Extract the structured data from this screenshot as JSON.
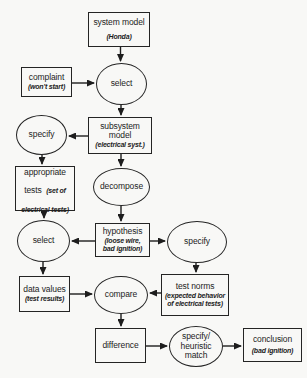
{
  "canvas": {
    "background": "#f8f8f6",
    "ink": "#1d1d1d"
  },
  "nodes": {
    "system_model": {
      "shape": "box",
      "title": "system model",
      "note": "(Honda)"
    },
    "complaint": {
      "shape": "box",
      "title": "complaint",
      "note": "(won't start)"
    },
    "select_1": {
      "shape": "ellipse",
      "title": "select"
    },
    "subsystem_model": {
      "shape": "box",
      "title": "subsystem model",
      "note": "(electrical syst.)"
    },
    "specify_left": {
      "shape": "ellipse",
      "title": "specify"
    },
    "appropriate_tests": {
      "shape": "box",
      "title": "appropriate tests",
      "note": "(set of electrical tests)"
    },
    "decompose": {
      "shape": "ellipse",
      "title": "decompose"
    },
    "select_2": {
      "shape": "ellipse",
      "title": "select"
    },
    "hypothesis": {
      "shape": "box",
      "title": "hypothesis",
      "note": "(loose wire, bad ignition)"
    },
    "specify_right": {
      "shape": "ellipse",
      "title": "specify"
    },
    "data_values": {
      "shape": "box",
      "title": "data values",
      "note": "(test results)"
    },
    "compare": {
      "shape": "ellipse",
      "title": "compare"
    },
    "test_norms": {
      "shape": "box",
      "title": "test norms",
      "note": "(expected behavior of electrical tests)"
    },
    "difference": {
      "shape": "box",
      "title": "difference"
    },
    "specify_heuristic": {
      "shape": "ellipse",
      "title": "specify/ heuristic match"
    },
    "conclusion": {
      "shape": "box",
      "title": "conclusion",
      "note": "(bad ignition)"
    }
  },
  "edges": [
    {
      "from": "system-model",
      "to": "select-1",
      "x1": 120.5,
      "y1": 47,
      "x2": 120.5,
      "y2": 61
    },
    {
      "from": "complaint",
      "to": "select-1",
      "x1": 72,
      "y1": 83,
      "x2": 94,
      "y2": 83
    },
    {
      "from": "select-1",
      "to": "subsystem-model",
      "x1": 121,
      "y1": 105,
      "x2": 121,
      "y2": 115
    },
    {
      "from": "subsystem-model",
      "to": "specify-left",
      "x1": 88,
      "y1": 136,
      "x2": 69,
      "y2": 136
    },
    {
      "from": "specify-left",
      "to": "appropriate-tests",
      "x1": 42,
      "y1": 155,
      "x2": 42,
      "y2": 164
    },
    {
      "from": "subsystem-model",
      "to": "decompose",
      "x1": 121,
      "y1": 154,
      "x2": 121,
      "y2": 166
    },
    {
      "from": "appropriate-tests",
      "to": "select-2",
      "x1": 44,
      "y1": 211,
      "x2": 44,
      "y2": 218
    },
    {
      "from": "decompose",
      "to": "hypothesis",
      "x1": 121,
      "y1": 206,
      "x2": 121,
      "y2": 221
    },
    {
      "from": "hypothesis",
      "to": "select-2",
      "x1": 95,
      "y1": 241,
      "x2": 72,
      "y2": 241
    },
    {
      "from": "hypothesis",
      "to": "specify-right",
      "x1": 150,
      "y1": 241,
      "x2": 165,
      "y2": 241
    },
    {
      "from": "select-2",
      "to": "data-values",
      "x1": 43,
      "y1": 262,
      "x2": 43,
      "y2": 274
    },
    {
      "from": "specify-right",
      "to": "test-norms",
      "x1": 196,
      "y1": 263,
      "x2": 196,
      "y2": 272
    },
    {
      "from": "data-values",
      "to": "compare",
      "x1": 70,
      "y1": 294,
      "x2": 92,
      "y2": 294
    },
    {
      "from": "test-norms",
      "to": "compare",
      "x1": 161,
      "y1": 293,
      "x2": 150,
      "y2": 293
    },
    {
      "from": "compare",
      "to": "difference",
      "x1": 121,
      "y1": 314,
      "x2": 121,
      "y2": 326
    },
    {
      "from": "difference",
      "to": "specify-heuristic",
      "x1": 146,
      "y1": 346,
      "x2": 167,
      "y2": 346
    },
    {
      "from": "specify-heuristic",
      "to": "conclusion",
      "x1": 223,
      "y1": 346,
      "x2": 241,
      "y2": 346
    }
  ]
}
